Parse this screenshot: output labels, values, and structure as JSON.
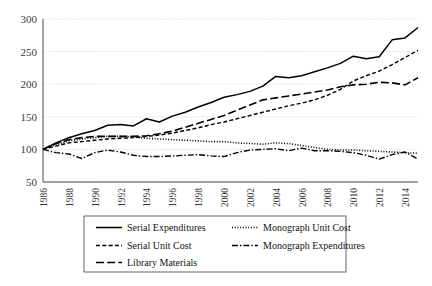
{
  "chart_data": {
    "type": "line",
    "title": "",
    "xlabel": "",
    "ylabel": "",
    "ylim": [
      50,
      300
    ],
    "yticks": [
      50,
      100,
      150,
      200,
      250,
      300
    ],
    "grid": true,
    "legend_position": "bottom",
    "x": [
      1986,
      1987,
      1988,
      1989,
      1990,
      1991,
      1992,
      1993,
      1994,
      1995,
      1996,
      1997,
      1998,
      1999,
      2000,
      2001,
      2002,
      2003,
      2004,
      2005,
      2006,
      2007,
      2008,
      2009,
      2010,
      2011,
      2012,
      2013,
      2014,
      2015
    ],
    "xtick_labels": [
      "1986",
      "1988",
      "1990",
      "1992",
      "1994",
      "1996",
      "1998",
      "2000",
      "2002",
      "2004",
      "2006",
      "2008",
      "2010",
      "2012",
      "2014"
    ],
    "series": [
      {
        "name": "Serial Expenditures",
        "style": "solid",
        "values": [
          100,
          110,
          118,
          124,
          129,
          137,
          138,
          136,
          147,
          142,
          151,
          157,
          165,
          172,
          180,
          184,
          189,
          197,
          212,
          210,
          213,
          219,
          225,
          232,
          243,
          239,
          242,
          268,
          271,
          287
        ]
      },
      {
        "name": "Monograph Unit Cost",
        "style": "dotted",
        "values": [
          100,
          107,
          113,
          116,
          118,
          120,
          120,
          119,
          117,
          116,
          115,
          114,
          113,
          112,
          112,
          110,
          109,
          108,
          110,
          109,
          106,
          103,
          100,
          99,
          99,
          98,
          97,
          96,
          95,
          94
        ]
      },
      {
        "name": "Serial Unit Cost",
        "style": "dashed",
        "values": [
          100,
          105,
          110,
          112,
          114,
          116,
          117,
          118,
          120,
          122,
          125,
          129,
          133,
          138,
          142,
          147,
          152,
          157,
          162,
          167,
          171,
          176,
          183,
          192,
          205,
          213,
          220,
          230,
          241,
          252
        ]
      },
      {
        "name": "Monograph Expenditures",
        "style": "dashdot",
        "values": [
          100,
          95,
          93,
          86,
          95,
          99,
          96,
          91,
          89,
          89,
          90,
          91,
          92,
          90,
          89,
          95,
          99,
          100,
          101,
          98,
          102,
          98,
          98,
          97,
          95,
          91,
          85,
          92,
          96,
          85
        ]
      },
      {
        "name": "Library Materials",
        "style": "longdash",
        "values": [
          100,
          109,
          115,
          118,
          120,
          120,
          120,
          120,
          121,
          124,
          128,
          134,
          140,
          146,
          152,
          160,
          168,
          176,
          179,
          182,
          185,
          188,
          191,
          196,
          199,
          200,
          203,
          202,
          199,
          210
        ]
      }
    ]
  },
  "legend": {
    "items": [
      {
        "label": "Serial Expenditures",
        "style": "solid"
      },
      {
        "label": "Monograph Unit Cost",
        "style": "dotted"
      },
      {
        "label": "Serial Unit Cost",
        "style": "dashed"
      },
      {
        "label": "Monograph Expenditures",
        "style": "dashdot"
      },
      {
        "label": "Library Materials",
        "style": "longdash"
      }
    ]
  },
  "colors": {
    "line": "#000000",
    "grid": "#bdbdbd",
    "axis": "#4a4a4a",
    "text": "#3a3a3a"
  }
}
